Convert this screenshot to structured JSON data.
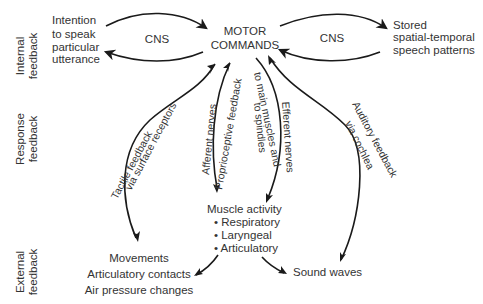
{
  "side_labels": {
    "internal": [
      "Internal",
      "feedback"
    ],
    "response": [
      "Response",
      "feedback"
    ],
    "external": [
      "External",
      "feedback"
    ]
  },
  "nodes": {
    "intention": [
      "Intention",
      "to speak",
      "particular",
      "utterance"
    ],
    "motor_commands": [
      "MOTOR",
      "COMMANDS"
    ],
    "stored_patterns": [
      "Stored",
      "spatial-temporal",
      "speech patterns"
    ],
    "muscle_activity": {
      "title": "Muscle activity",
      "items": [
        "• Respiratory",
        "• Laryngeal",
        "• Articulatory"
      ]
    },
    "movements": [
      "Movements",
      "Articulatory contacts",
      "Air pressure changes"
    ],
    "sound_waves": "Sound waves"
  },
  "edge_labels": {
    "cns_left": "CNS",
    "cns_right": "CNS",
    "tactile_1": "Tactile feedback",
    "tactile_2": "via surface receptors",
    "afferent_1": "Afferent nerves",
    "afferent_2": "Proprioceptive feedback",
    "efferent_1": "to main muscles and",
    "efferent_2": "to spindles",
    "efferent_3": "Efferent nerves",
    "auditory_1": "Auditory feedback",
    "auditory_2": "via cochlea"
  },
  "colors": {
    "text": "#333333",
    "line": "#1a1a1a",
    "background": "#ffffff"
  }
}
